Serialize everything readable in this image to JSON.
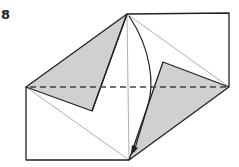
{
  "step": {
    "number": "8"
  },
  "diagram": {
    "colors": {
      "paper_front": "#ffffff",
      "paper_back": "#d0d0d0",
      "edge": "#222222",
      "crease": "#999999",
      "valley_fold": "#444444"
    },
    "elements": [
      "outline",
      "left-shaded-flap",
      "right-shaded-flap",
      "diagonal-creases",
      "vertical-crease",
      "valley-fold-line",
      "curved-fold-arrow"
    ]
  }
}
